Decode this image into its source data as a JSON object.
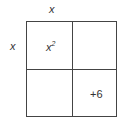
{
  "diagram": {
    "type": "area-model",
    "top_label": "x",
    "left_label": "x",
    "cells": [
      {
        "row": 0,
        "col": 0,
        "base": "x",
        "exponent": "2"
      },
      {
        "row": 0,
        "col": 1,
        "text": ""
      },
      {
        "row": 1,
        "col": 0,
        "text": ""
      },
      {
        "row": 1,
        "col": 1,
        "text": "+6"
      }
    ]
  }
}
